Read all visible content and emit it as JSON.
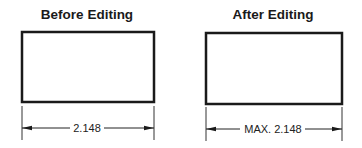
{
  "panels": [
    {
      "title": "Before Editing",
      "dimension_text": "2.148",
      "rect": {
        "x": 22,
        "y": 32,
        "w": 132,
        "h": 70
      },
      "dim_y": 128,
      "ext_top": 106,
      "ext_bottom": 140
    },
    {
      "title": "After Editing",
      "dimension_text": "MAX. 2.148",
      "rect": {
        "x": 206,
        "y": 33,
        "w": 136,
        "h": 71
      },
      "dim_y": 129,
      "ext_top": 107,
      "ext_bottom": 141
    }
  ],
  "colors": {
    "stroke": "#1a1a1a",
    "background": "#ffffff"
  }
}
